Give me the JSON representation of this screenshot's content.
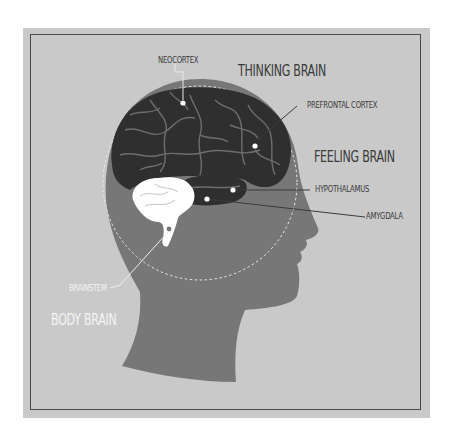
{
  "diagram": {
    "labels": {
      "neocortex": "NEOCORTEX",
      "thinking_brain": "THINKING BRAIN",
      "prefrontal_cortex": "PREFRONTAL CORTEX",
      "feeling_brain": "FEELING BRAIN",
      "hypothalamus": "HYPOTHALAMUS",
      "amygdala": "AMYGDALA",
      "brainstem": "BRAINSTEM",
      "body_brain": "BODY BRAIN"
    },
    "colors": {
      "background": "#c9c9c9",
      "head": "#777777",
      "brain": "#2f2f2f",
      "brainstem_cerebellum": "#ffffff",
      "frame": "#4a4a4a",
      "text": "#3a3a3a"
    }
  }
}
